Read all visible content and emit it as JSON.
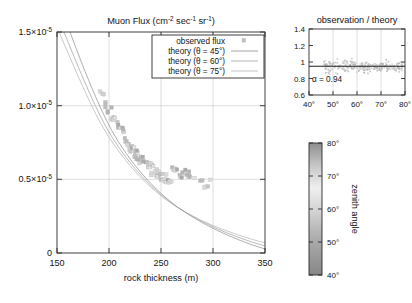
{
  "figure": {
    "width": 412,
    "height": 303,
    "background": "#ffffff"
  },
  "main_plot": {
    "title": "Muon Flux (cm",
    "title_sup1": "-2",
    "title_mid": " sec",
    "title_sup2": "-1",
    "title_mid2": " sr",
    "title_sup3": "-1",
    "title_end": ")",
    "xlabel": "rock thickness (m)",
    "xticks": [
      "150",
      "200",
      "250",
      "300",
      "350"
    ],
    "xtick_values": [
      150,
      200,
      250,
      300,
      350
    ],
    "ytick_labels": [
      "0",
      "0.5×10",
      "1.0×10",
      "1.5×10"
    ],
    "ytick_sup": [
      "",
      "-5",
      "-5",
      "-5"
    ],
    "ytick_values": [
      0,
      5e-06,
      1e-05,
      1.5e-05
    ],
    "xlim": [
      150,
      350
    ],
    "ylim": [
      0,
      1.5e-05
    ]
  },
  "legend": {
    "entries": [
      {
        "label": "observed flux",
        "marker": "square",
        "color": "#b9b9b9"
      },
      {
        "label": "theory (θ = 45°)",
        "marker": "line",
        "color": "#9a9a9a"
      },
      {
        "label": "theory (θ = 60°)",
        "marker": "line",
        "color": "#ababab"
      },
      {
        "label": "theory (θ = 75°)",
        "marker": "line",
        "color": "#bcbcbc"
      }
    ]
  },
  "inset_plot": {
    "title": "observation / theory",
    "yticks": [
      "0.6",
      "0.8",
      "1",
      "1.2",
      "1.4"
    ],
    "ytick_values": [
      0.6,
      0.8,
      1.0,
      1.2,
      1.4
    ],
    "xticks": [
      "40°",
      "50°",
      "60°",
      "70°",
      "80°"
    ],
    "xtick_values": [
      40,
      50,
      60,
      70,
      80
    ],
    "annotation": "α = 0.94",
    "reference_level": 0.94,
    "xlim": [
      40,
      80
    ],
    "ylim": [
      0.6,
      1.4
    ]
  },
  "colorbar": {
    "label": "zenith angle",
    "ticks": [
      "80°",
      "70°",
      "60°",
      "50°",
      "40°"
    ],
    "tick_values": [
      80,
      70,
      60,
      50,
      40
    ],
    "range": [
      40,
      80
    ],
    "gradient_stops": [
      {
        "pos": 0,
        "color": "#8f8f8f"
      },
      {
        "pos": 18,
        "color": "#c9c9c9"
      },
      {
        "pos": 34,
        "color": "#efefef"
      },
      {
        "pos": 52,
        "color": "#d2d2d2"
      },
      {
        "pos": 70,
        "color": "#b0b0b0"
      },
      {
        "pos": 86,
        "color": "#9a9a9a"
      },
      {
        "pos": 100,
        "color": "#868686"
      }
    ]
  },
  "chart_data": {
    "type": "scatter",
    "title": "Muon Flux (cm-2 sec-1 sr-1)",
    "xlabel": "rock thickness (m)",
    "ylabel": "",
    "xlim": [
      150,
      350
    ],
    "ylim": [
      0,
      1.5e-05
    ],
    "grid": true,
    "legend_position": "top-center",
    "colormap": "grayscale by zenith angle (40°-80°)",
    "series": [
      {
        "name": "observed flux",
        "type": "scatter",
        "marker": "square",
        "x": [
          193,
          195,
          196,
          198,
          200,
          202,
          203,
          205,
          206,
          208,
          209,
          210,
          212,
          213,
          214,
          215,
          216,
          217,
          218,
          219,
          220,
          221,
          222,
          223,
          224,
          225,
          226,
          227,
          228,
          229,
          230,
          231,
          232,
          233,
          234,
          235,
          236,
          237,
          238,
          239,
          240,
          241,
          242,
          243,
          244,
          245,
          246,
          247,
          248,
          249,
          250,
          251,
          252,
          253,
          254,
          255,
          256,
          257,
          258,
          259,
          260,
          261,
          262,
          263,
          264,
          265,
          267,
          269,
          271,
          273,
          275,
          277,
          279,
          283,
          288,
          292,
          296,
          298
        ],
        "y": [
          1.1e-05,
          1.07e-05,
          1.04e-05,
          1.01e-05,
          9.9e-06,
          9.6e-06,
          9.4e-06,
          9.2e-06,
          9e-06,
          8.8e-06,
          8.7e-06,
          8.5e-06,
          8.3e-06,
          8.2e-06,
          8e-06,
          7.8e-06,
          7.7e-06,
          7.6e-06,
          7.5e-06,
          7.4e-06,
          7.3e-06,
          7.2e-06,
          7.1e-06,
          7e-06,
          6.9e-06,
          6.8e-06,
          6.7e-06,
          6.6e-06,
          6.6e-06,
          6.5e-06,
          6.4e-06,
          6.3e-06,
          6.3e-06,
          6.2e-06,
          6.1e-06,
          6e-06,
          6e-06,
          5.9e-06,
          5.8e-06,
          5.8e-06,
          5.7e-06,
          5.7e-06,
          5.6e-06,
          5.6e-06,
          5.5e-06,
          5.5e-06,
          5.4e-06,
          5.4e-06,
          5.3e-06,
          5.3e-06,
          5.2e-06,
          5.2e-06,
          5.1e-06,
          5.1e-06,
          5.1e-06,
          5e-06,
          5e-06,
          5e-06,
          4.9e-06,
          4.9e-06,
          5.8e-06,
          5.7e-06,
          5.6e-06,
          5.6e-06,
          5.5e-06,
          5.5e-06,
          5.4e-06,
          5.3e-06,
          5.2e-06,
          5.2e-06,
          5.1e-06,
          5.1e-06,
          5e-06,
          4.9e-06,
          4.8e-06,
          4.7e-06,
          4.7e-06,
          4.7e-06
        ]
      },
      {
        "name": "theory (θ = 45°)",
        "type": "line",
        "color": "#9a9a9a",
        "description": "decaying flux vs rock thickness, lowest of the three curves"
      },
      {
        "name": "theory (θ = 60°)",
        "type": "line",
        "color": "#ababab",
        "description": "decaying flux vs rock thickness, middle curve"
      },
      {
        "name": "theory (θ = 75°)",
        "type": "line",
        "color": "#bcbcbc",
        "description": "decaying flux vs rock thickness, highest curve"
      }
    ],
    "inset": {
      "type": "scatter",
      "title": "observation / theory",
      "xlabel": "",
      "ylabel": "",
      "xlim": [
        40,
        80
      ],
      "ylim": [
        0.6,
        1.4
      ],
      "xticks": [
        40,
        50,
        60,
        70,
        80
      ],
      "yticks": [
        0.6,
        0.8,
        1.0,
        1.2,
        1.4
      ],
      "reference_line": 0.94,
      "annotation": "α = 0.94"
    }
  }
}
